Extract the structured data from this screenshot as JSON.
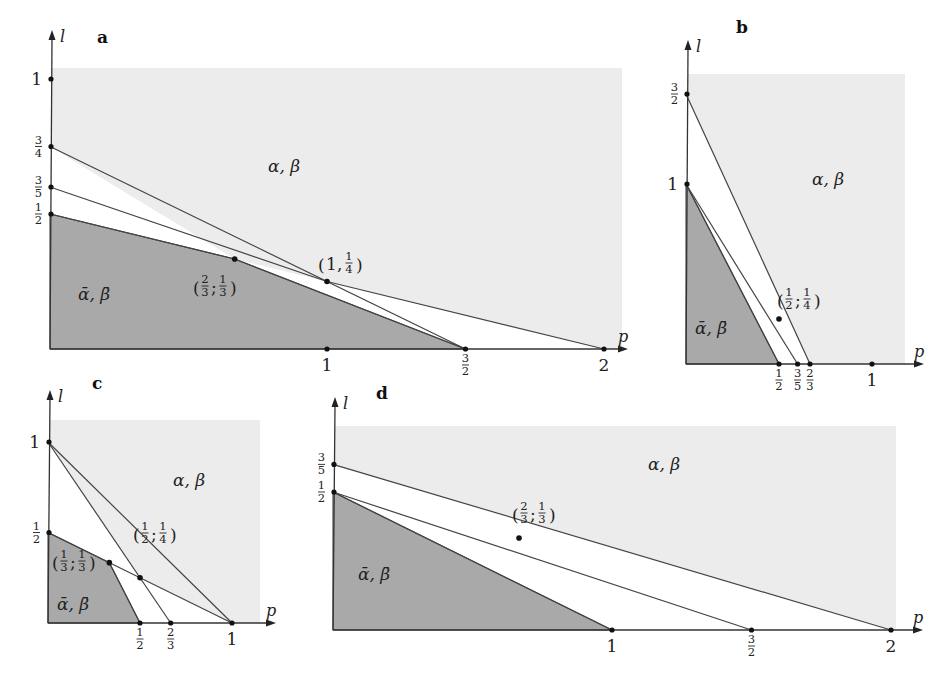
{
  "figure": {
    "colors": {
      "background": "#ffffff",
      "region_light": "#ececec",
      "region_dark": "#a9a9a9",
      "band": "#ffffff",
      "line": "#444444"
    },
    "panels": [
      {
        "id": "a",
        "letter": "a",
        "axis_x_label": "p",
        "axis_y_label": "l",
        "origin": [
          50,
          349
        ],
        "scale": [
          277,
          270
        ],
        "axis_x_end": 620,
        "axis_y_end": 38,
        "light_box": [
          52,
          68,
          622,
          349
        ],
        "letter_pos": [
          97,
          30
        ],
        "y_ticks": [
          {
            "value": 1,
            "label": "1"
          },
          {
            "value": 0.75,
            "label": "3/4"
          },
          {
            "value": 0.6,
            "label": "3/5"
          },
          {
            "value": 0.5,
            "label": "1/2"
          }
        ],
        "x_ticks": [
          {
            "value": 1,
            "label": "1"
          },
          {
            "value": 1.5,
            "label": "3/2"
          },
          {
            "value": 2,
            "label": "2"
          }
        ],
        "lines": [
          {
            "from": [
              0,
              0.75
            ],
            "to": [
              1.5,
              0
            ]
          },
          {
            "from": [
              0,
              0.6
            ],
            "to": [
              1,
              0.25
            ]
          },
          {
            "from": [
              1,
              0.25
            ],
            "to": [
              2,
              0
            ]
          },
          {
            "from": [
              0,
              0.5
            ],
            "to": [
              0.6667,
              0.3333
            ]
          },
          {
            "from": [
              0.6667,
              0.3333
            ],
            "to": [
              1.5,
              0
            ]
          }
        ],
        "dark_polygon": [
          [
            0,
            0
          ],
          [
            0,
            0.5
          ],
          [
            0.6667,
            0.3333
          ],
          [
            1.5,
            0
          ]
        ],
        "white_polygon": [
          [
            0,
            0.5
          ],
          [
            0,
            0.75
          ],
          [
            0.6667,
            0.3333
          ],
          [
            1,
            0.25
          ],
          [
            2,
            0
          ],
          [
            1.5,
            0
          ],
          [
            0.6667,
            0.3333
          ]
        ],
        "points": [
          {
            "at": [
              0.6667,
              0.3333
            ],
            "label": "(2/3; 1/3)",
            "label_pos": [
              193,
              300
            ]
          },
          {
            "at": [
              1,
              0.25
            ],
            "label": "(1, 1/4)",
            "label_pos": [
              318,
              277
            ]
          }
        ],
        "region_labels": [
          {
            "text": "α, β",
            "pos": [
              268,
              172
            ],
            "bar": false
          },
          {
            "text": "ᾱ, β̄",
            "pos": [
              78,
              300
            ],
            "bar": true
          }
        ]
      },
      {
        "id": "b",
        "letter": "b",
        "axis_x_label": "p",
        "axis_y_label": "l",
        "origin": [
          686,
          364
        ],
        "scale": [
          186,
          180
        ],
        "axis_x_end": 916,
        "axis_y_end": 48,
        "light_box": [
          688,
          74,
          905,
          364
        ],
        "letter_pos": [
          736,
          20
        ],
        "y_ticks": [
          {
            "value": 1.5,
            "label": "3/2"
          },
          {
            "value": 1,
            "label": "1"
          }
        ],
        "x_ticks": [
          {
            "value": 0.5,
            "label": "1/2"
          },
          {
            "value": 0.6,
            "label": "3/5"
          },
          {
            "value": 0.6667,
            "label": "2/3"
          },
          {
            "value": 1,
            "label": "1"
          }
        ],
        "lines": [
          {
            "from": [
              0,
              1.5
            ],
            "to": [
              0.6667,
              0
            ]
          },
          {
            "from": [
              0,
              1
            ],
            "to": [
              0.6,
              0
            ]
          },
          {
            "from": [
              0,
              1
            ],
            "to": [
              0.5,
              0
            ]
          }
        ],
        "dark_polygon": [
          [
            0,
            0
          ],
          [
            0,
            1
          ],
          [
            0.5,
            0
          ]
        ],
        "white_polygon": [
          [
            0,
            1
          ],
          [
            0,
            1.5
          ],
          [
            0.6667,
            0
          ],
          [
            0.5,
            0
          ]
        ],
        "points": [
          {
            "at": [
              0.5,
              0.25
            ],
            "label": "(1/2; 1/4)",
            "label_pos": [
              777,
              313
            ]
          }
        ],
        "region_labels": [
          {
            "text": "α, β",
            "pos": [
              812,
              185
            ],
            "bar": false
          },
          {
            "text": "ᾱ, β̄",
            "pos": [
              695,
              334
            ],
            "bar": true
          }
        ]
      },
      {
        "id": "c",
        "letter": "c",
        "axis_x_label": "p",
        "axis_y_label": "l",
        "origin": [
          48,
          623
        ],
        "scale": [
          184,
          181
        ],
        "axis_x_end": 268,
        "axis_y_end": 398,
        "light_box": [
          50,
          420,
          260,
          623
        ],
        "letter_pos": [
          92,
          376
        ],
        "y_ticks": [
          {
            "value": 1,
            "label": "1"
          },
          {
            "value": 0.5,
            "label": "1/2"
          }
        ],
        "x_ticks": [
          {
            "value": 0.5,
            "label": "1/2"
          },
          {
            "value": 0.6667,
            "label": "2/3"
          },
          {
            "value": 1,
            "label": "1"
          }
        ],
        "lines": [
          {
            "from": [
              0,
              1
            ],
            "to": [
              1,
              0
            ]
          },
          {
            "from": [
              0,
              1
            ],
            "to": [
              0.6667,
              0
            ]
          },
          {
            "from": [
              0,
              0.5
            ],
            "to": [
              1,
              0
            ]
          },
          {
            "from": [
              0.3333,
              0.3333
            ],
            "to": [
              0.5,
              0
            ]
          }
        ],
        "dark_polygon": [
          [
            0,
            0
          ],
          [
            0,
            0.5
          ],
          [
            0.3333,
            0.3333
          ],
          [
            0.5,
            0
          ]
        ],
        "white_polygon": [
          [
            0,
            0.5
          ],
          [
            0,
            1
          ],
          [
            0.5,
            0.25
          ],
          [
            1,
            0
          ],
          [
            0.5,
            0
          ],
          [
            0.3333,
            0.3333
          ]
        ],
        "points": [
          {
            "at": [
              0.3333,
              0.3333
            ],
            "label": "(1/3; 1/3)",
            "label_pos": [
              52,
              575
            ]
          },
          {
            "at": [
              0.5,
              0.25
            ],
            "label": "(1/2; 1/4)",
            "label_pos": [
              133,
              547
            ]
          }
        ],
        "region_labels": [
          {
            "text": "α, β",
            "pos": [
              173,
              486
            ],
            "bar": false
          },
          {
            "text": "ᾱ, β̄",
            "pos": [
              57,
              610
            ],
            "bar": true
          }
        ]
      },
      {
        "id": "d",
        "letter": "d",
        "axis_x_label": "p",
        "axis_y_label": "l",
        "origin": [
          333,
          630
        ],
        "scale": [
          279,
          276
        ],
        "axis_x_end": 915,
        "axis_y_end": 405,
        "light_box": [
          335,
          426,
          896,
          630
        ],
        "letter_pos": [
          376,
          386
        ],
        "y_ticks": [
          {
            "value": 0.6,
            "label": "3/5"
          },
          {
            "value": 0.5,
            "label": "1/2"
          }
        ],
        "x_ticks": [
          {
            "value": 1,
            "label": "1"
          },
          {
            "value": 1.5,
            "label": "3/2"
          },
          {
            "value": 2,
            "label": "2"
          }
        ],
        "lines": [
          {
            "from": [
              0,
              0.6
            ],
            "to": [
              2,
              0
            ]
          },
          {
            "from": [
              0,
              0.5
            ],
            "to": [
              1.5,
              0
            ]
          },
          {
            "from": [
              0,
              0.5
            ],
            "to": [
              1,
              0
            ]
          }
        ],
        "dark_polygon": [
          [
            0,
            0
          ],
          [
            0,
            0.5
          ],
          [
            1,
            0
          ]
        ],
        "white_polygon": [
          [
            0,
            0.5
          ],
          [
            0,
            0.6
          ],
          [
            0.6667,
            0.4
          ],
          [
            2,
            0
          ],
          [
            1,
            0
          ]
        ],
        "points": [
          {
            "at": [
              0.6667,
              0.3333
            ],
            "label": "(2/3; 1/3)",
            "label_pos": [
              512,
              527
            ]
          }
        ],
        "region_labels": [
          {
            "text": "α, β",
            "pos": [
              648,
              470
            ],
            "bar": false
          },
          {
            "text": "ᾱ, β̄",
            "pos": [
              358,
              580
            ],
            "bar": true
          }
        ]
      }
    ]
  }
}
